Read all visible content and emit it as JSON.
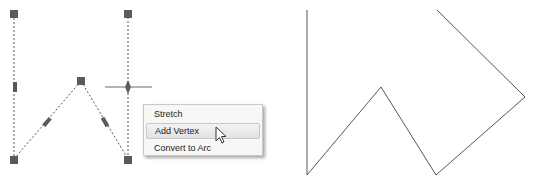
{
  "context_menu": {
    "items": [
      {
        "label": "Stretch",
        "highlighted": false
      },
      {
        "label": "Add Vertex",
        "highlighted": true
      },
      {
        "label": "Convert to Arc",
        "highlighted": false
      }
    ]
  },
  "left_polyline": {
    "style": "dashed-selected",
    "vertices": [
      [
        14,
        14
      ],
      [
        14,
        159
      ],
      [
        81,
        81
      ],
      [
        128,
        159
      ],
      [
        128,
        14
      ]
    ],
    "grip_color": "#5a5a5a"
  },
  "right_polyline": {
    "style": "solid",
    "vertices": [
      [
        307,
        10
      ],
      [
        307,
        175
      ],
      [
        381,
        87
      ],
      [
        436,
        175
      ],
      [
        525,
        97
      ],
      [
        437,
        10
      ]
    ],
    "stroke_color": "#555555"
  }
}
